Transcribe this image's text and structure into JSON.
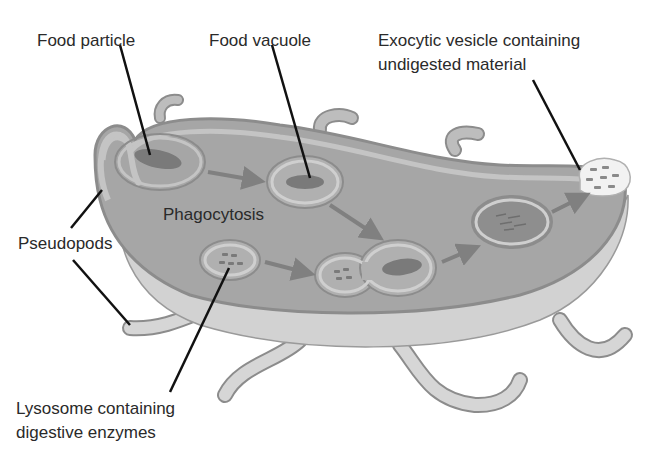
{
  "figure": {
    "clipped_title_fragment": "...g y ...",
    "labels": {
      "food_particle": "Food particle",
      "food_vacuole": "Food vacuole",
      "exocytic_line1": "Exocytic vesicle containing",
      "exocytic_line2": "undigested material",
      "phagocytosis": "Phagocytosis",
      "pseudopods": "Pseudopods",
      "lysosome_line1": "Lysosome containing",
      "lysosome_line2": "digestive enzymes"
    },
    "colors": {
      "cytoplasm": "#a6a6a6",
      "membrane": "#c4c4c4",
      "membrane_edge": "#8c8c8c",
      "underside": "#d2d2d2",
      "food": "#7a7a7a",
      "arrow": "#808080",
      "leader_line": "#111111",
      "text": "#2a2a2a"
    }
  }
}
